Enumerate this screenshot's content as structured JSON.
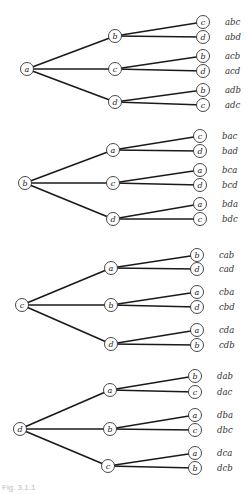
{
  "diagram": {
    "type": "permutation-tree",
    "trees": [
      {
        "root": "a",
        "root_pos": [
          27,
          69
        ],
        "branches": [
          {
            "node": "b",
            "pos": [
              115,
              36
            ],
            "leaves": [
              {
                "node": "c",
                "pos": [
                  203,
                  22
                ],
                "label": "abc"
              },
              {
                "node": "d",
                "pos": [
                  203,
                  37
                ],
                "label": "abd"
              }
            ]
          },
          {
            "node": "c",
            "pos": [
              115,
              69
            ],
            "leaves": [
              {
                "node": "b",
                "pos": [
                  203,
                  56
                ],
                "label": "acb"
              },
              {
                "node": "d",
                "pos": [
                  203,
                  71
                ],
                "label": "acd"
              }
            ]
          },
          {
            "node": "d",
            "pos": [
              115,
              102
            ],
            "leaves": [
              {
                "node": "b",
                "pos": [
                  203,
                  90
                ],
                "label": "adb"
              },
              {
                "node": "c",
                "pos": [
                  203,
                  105
                ],
                "label": "adc"
              }
            ]
          }
        ]
      },
      {
        "root": "b",
        "root_pos": [
          25,
          183
        ],
        "branches": [
          {
            "node": "a",
            "pos": [
              113,
              150
            ],
            "leaves": [
              {
                "node": "c",
                "pos": [
                  200,
                  136
                ],
                "label": "bac"
              },
              {
                "node": "d",
                "pos": [
                  200,
                  151
                ],
                "label": "bad"
              }
            ]
          },
          {
            "node": "c",
            "pos": [
              113,
              183
            ],
            "leaves": [
              {
                "node": "a",
                "pos": [
                  200,
                  170
                ],
                "label": "bca"
              },
              {
                "node": "d",
                "pos": [
                  200,
                  185
                ],
                "label": "bcd"
              }
            ]
          },
          {
            "node": "d",
            "pos": [
              113,
              219
            ],
            "leaves": [
              {
                "node": "a",
                "pos": [
                  200,
                  204
                ],
                "label": "bda"
              },
              {
                "node": "c",
                "pos": [
                  200,
                  219
                ],
                "label": "bdc"
              }
            ]
          }
        ]
      },
      {
        "root": "c",
        "root_pos": [
          22,
          305
        ],
        "branches": [
          {
            "node": "a",
            "pos": [
              111,
              268
            ],
            "leaves": [
              {
                "node": "b",
                "pos": [
                  197,
                  255
                ],
                "label": "cab"
              },
              {
                "node": "d",
                "pos": [
                  197,
                  269
                ],
                "label": "cad"
              }
            ]
          },
          {
            "node": "b",
            "pos": [
              111,
              305
            ],
            "leaves": [
              {
                "node": "a",
                "pos": [
                  197,
                  292
                ],
                "label": "cba"
              },
              {
                "node": "d",
                "pos": [
                  197,
                  307
                ],
                "label": "cbd"
              }
            ]
          },
          {
            "node": "d",
            "pos": [
              111,
              344
            ],
            "leaves": [
              {
                "node": "a",
                "pos": [
                  197,
                  330
                ],
                "label": "cda"
              },
              {
                "node": "b",
                "pos": [
                  197,
                  345
                ],
                "label": "cdb"
              }
            ]
          }
        ]
      },
      {
        "root": "d",
        "root_pos": [
          20,
          429
        ],
        "branches": [
          {
            "node": "a",
            "pos": [
              110,
              390
            ],
            "leaves": [
              {
                "node": "b",
                "pos": [
                  195,
                  376
                ],
                "label": "dab"
              },
              {
                "node": "c",
                "pos": [
                  195,
                  392
                ],
                "label": "dac"
              }
            ]
          },
          {
            "node": "b",
            "pos": [
              110,
              429
            ],
            "leaves": [
              {
                "node": "a",
                "pos": [
                  195,
                  415
                ],
                "label": "dba"
              },
              {
                "node": "c",
                "pos": [
                  195,
                  430
                ],
                "label": "dbc"
              }
            ]
          },
          {
            "node": "c",
            "pos": [
              108,
              466
            ],
            "leaves": [
              {
                "node": "a",
                "pos": [
                  195,
                  453
                ],
                "label": "dca"
              },
              {
                "node": "b",
                "pos": [
                  195,
                  468
                ],
                "label": "dcb"
              }
            ]
          }
        ]
      }
    ],
    "caption": "Fig. 3.1.1"
  },
  "style": {
    "edge_color": "#1a1a1a",
    "node_stroke": "#333333",
    "background": "#ffffff"
  }
}
